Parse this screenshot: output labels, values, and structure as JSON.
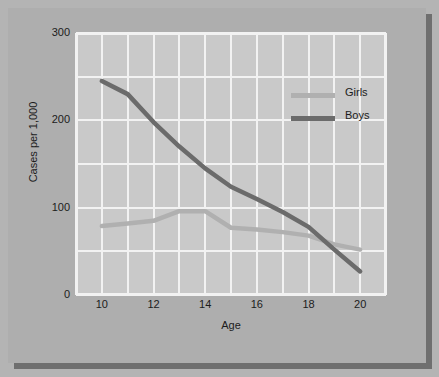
{
  "chart_data": {
    "type": "line",
    "title": "",
    "xlabel": "Age",
    "ylabel": "Cases per 1,000",
    "xlim": [
      9,
      21
    ],
    "ylim": [
      0,
      300
    ],
    "xticks": [
      "10",
      "12",
      "14",
      "16",
      "18",
      "20"
    ],
    "xtick_values": [
      10,
      12,
      14,
      16,
      18,
      20
    ],
    "yticks": [
      "0",
      "100",
      "200",
      "300"
    ],
    "ytick_values": [
      0,
      100,
      200,
      300
    ],
    "grid": "major horizontal every 50, minor vertical every 1 year",
    "grid_color": "#f2f2f2",
    "legend_position": "inside upper right",
    "x": [
      10,
      11,
      12,
      13,
      14,
      15,
      16,
      17,
      18,
      19,
      20
    ],
    "series": [
      {
        "name": "Girls",
        "color": "#b0b0b0",
        "values": [
          79,
          82,
          85,
          96,
          96,
          77,
          75,
          72,
          68,
          58,
          52
        ]
      },
      {
        "name": "Boys",
        "color": "#6b6b6b",
        "values": [
          245,
          230,
          198,
          170,
          145,
          124,
          110,
          95,
          78,
          52,
          27
        ]
      }
    ]
  },
  "legend": {
    "items": [
      {
        "label": "Girls",
        "color": "#b0b0b0"
      },
      {
        "label": "Boys",
        "color": "#6b6b6b"
      }
    ]
  },
  "colors": {
    "background": "#b4b4b4",
    "card": "#aeaeae",
    "plot_panel": "#c9c9c9",
    "grid": "#f2f2f2",
    "shadow": "#6f6f6f",
    "text": "#1c1c1c"
  }
}
